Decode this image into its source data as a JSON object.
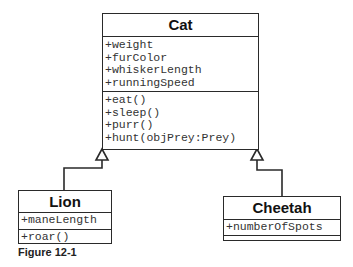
{
  "classes": {
    "cat": {
      "name": "Cat",
      "attributes": [
        "+weight",
        "+furColor",
        "+whiskerLength",
        "+runningSpeed"
      ],
      "methods": [
        "+eat()",
        "+sleep()",
        "+purr()",
        "+hunt(objPrey:Prey)"
      ]
    },
    "lion": {
      "name": "Lion",
      "attributes": [
        "+maneLength"
      ],
      "methods": [
        "+roar()"
      ]
    },
    "cheetah": {
      "name": "Cheetah",
      "attributes": [
        "+numberOfSpots"
      ],
      "methods": []
    }
  },
  "relationships": [
    {
      "type": "generalization",
      "from": "Lion",
      "to": "Cat"
    },
    {
      "type": "generalization",
      "from": "Cheetah",
      "to": "Cat"
    }
  ],
  "caption": "Figure 12-1"
}
